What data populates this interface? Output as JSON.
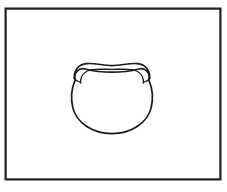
{
  "figure": {
    "background_color": "#ffffff",
    "stroke_color": "#1a1a1a",
    "fill_color": "none",
    "canvas": {
      "width": 227,
      "height": 192
    }
  },
  "frame": {
    "name": "rectangular border",
    "x": 5.5,
    "y": 8.5,
    "width": 215,
    "height": 171,
    "stroke_width": 2.2,
    "stroke_color": "#1f1f1f",
    "fill": "#ffffff"
  },
  "subject": {
    "name": "bowl",
    "bounds": {
      "x": 71,
      "y": 63,
      "width": 82,
      "height": 72
    },
    "center_x": 112,
    "parts": [
      {
        "name": "bowl-body",
        "label": "body",
        "stroke_width": 1.7,
        "fill": "none"
      },
      {
        "name": "bowl-rim-outer",
        "label": "rim outer arc",
        "stroke_width": 1.6,
        "fill": "none"
      },
      {
        "name": "bowl-rim-inner",
        "label": "rim inner arc",
        "stroke_width": 1.4,
        "fill": "none"
      },
      {
        "name": "rim-notch-left",
        "label": "left notch",
        "stroke_width": 1.4,
        "fill": "none"
      },
      {
        "name": "rim-notch-right",
        "label": "right notch",
        "stroke_width": 1.4,
        "fill": "none"
      }
    ]
  },
  "annotations": {
    "text_present": false,
    "labels": []
  }
}
